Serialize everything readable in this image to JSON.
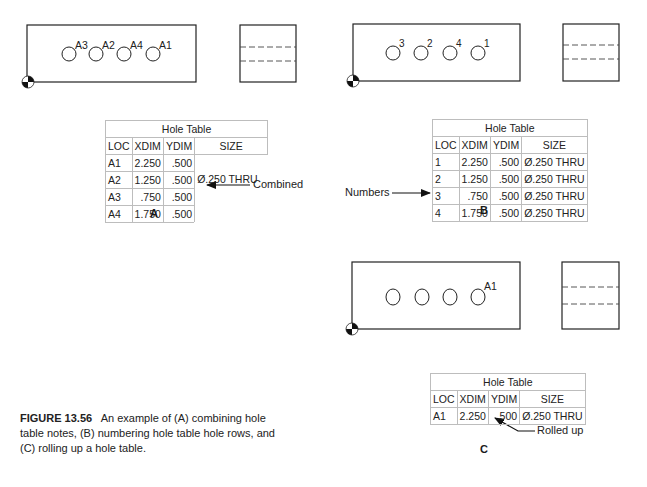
{
  "figure": {
    "number": "FIGURE 13.56",
    "caption": "An example of (A) combining hole table notes, (B) numbering hole table hole rows, and (C) rolling up a hole table."
  },
  "panels": {
    "A": {
      "label": "A",
      "hole_tags": [
        "A3",
        "A2",
        "A4",
        "A1"
      ],
      "callout": "Combined",
      "table": {
        "title": "Hole Table",
        "headers": [
          "LOC",
          "XDIM",
          "YDIM",
          "SIZE"
        ],
        "rows": [
          {
            "loc": "A1",
            "xdim": "2.250",
            "ydim": ".500"
          },
          {
            "loc": "A2",
            "xdim": "1.250",
            "ydim": ".500"
          },
          {
            "loc": "A3",
            "xdim": ".750",
            "ydim": ".500"
          },
          {
            "loc": "A4",
            "xdim": "1.750",
            "ydim": ".500"
          }
        ],
        "combined_size": "Ø.250 THRU"
      }
    },
    "B": {
      "label": "B",
      "hole_tags": [
        "3",
        "2",
        "4",
        "1"
      ],
      "callout": "Numbers",
      "table": {
        "title": "Hole Table",
        "headers": [
          "LOC",
          "XDIM",
          "YDIM",
          "SIZE"
        ],
        "rows": [
          {
            "loc": "1",
            "xdim": "2.250",
            "ydim": ".500",
            "size": "Ø.250 THRU"
          },
          {
            "loc": "2",
            "xdim": "1.250",
            "ydim": ".500",
            "size": "Ø.250 THRU"
          },
          {
            "loc": "3",
            "xdim": ".750",
            "ydim": ".500",
            "size": "Ø.250 THRU"
          },
          {
            "loc": "4",
            "xdim": "1.750",
            "ydim": ".500",
            "size": "Ø.250 THRU"
          }
        ]
      }
    },
    "C": {
      "label": "C",
      "hole_tags": [
        "A1"
      ],
      "callout": "Rolled up",
      "table": {
        "title": "Hole Table",
        "headers": [
          "LOC",
          "XDIM",
          "YDIM",
          "SIZE"
        ],
        "rows": [
          {
            "loc": "A1",
            "xdim": "2.250",
            "ydim": ".500",
            "size": "Ø.250 THRU"
          }
        ]
      }
    }
  }
}
